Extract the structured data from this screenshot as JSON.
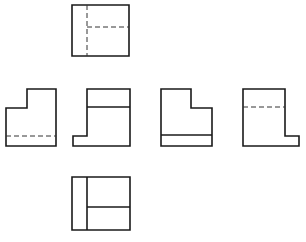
{
  "diagram": {
    "title": "",
    "type": "orthographic-six-views",
    "colors": {
      "line": "#1a1a1a",
      "background": "#ffffff",
      "hidden": "#333333"
    },
    "views": [
      {
        "name": "top-view",
        "outline": "72,5 129,5 129,56 72,56",
        "visible_lines": [],
        "hidden_lines": [
          [
            87,
            5,
            87,
            56
          ],
          [
            87,
            27,
            129,
            27
          ]
        ]
      },
      {
        "name": "left-view",
        "outline": "6,108 27,108 27,89 56,89 56,146 6,146",
        "visible_lines": [],
        "hidden_lines": [
          [
            6,
            136,
            56,
            136
          ]
        ]
      },
      {
        "name": "front-view",
        "outline": "87,89 130,89 130,146 73,146 73,136 87,136",
        "visible_lines": [
          [
            87,
            107,
            130,
            107
          ]
        ],
        "hidden_lines": []
      },
      {
        "name": "right-view",
        "outline": "161,89 191,89 191,108 212,108 212,146 161,146",
        "visible_lines": [
          [
            161,
            135,
            212,
            135
          ]
        ],
        "hidden_lines": []
      },
      {
        "name": "rear-view",
        "outline": "243,89 285,89 285,136 299,136 299,146 243,146",
        "visible_lines": [],
        "hidden_lines": [
          [
            243,
            107,
            285,
            107
          ]
        ]
      },
      {
        "name": "bottom-view",
        "outline": "72,177 130,177 130,230 72,230",
        "visible_lines": [
          [
            87,
            177,
            87,
            230
          ],
          [
            87,
            207,
            130,
            207
          ]
        ],
        "hidden_lines": []
      }
    ]
  }
}
